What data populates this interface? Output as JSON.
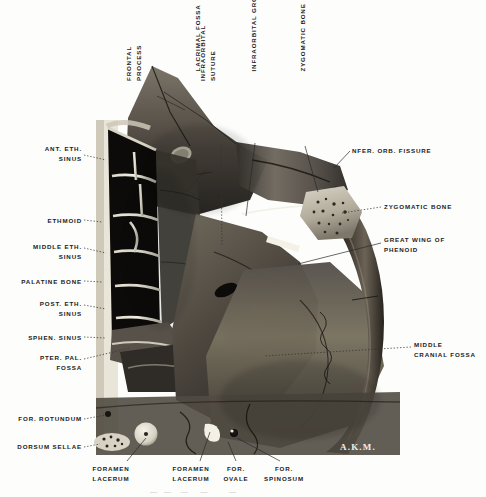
{
  "figure": {
    "signature": "A.K.M.",
    "caption_partial": "—  —   —    —       —",
    "background_color": "#fdfdfb",
    "plate_bounds": {
      "x": 90,
      "y": 55,
      "width": 310,
      "height": 400
    }
  },
  "labels": {
    "vertical_top": [
      {
        "id": "frontal-process",
        "text": "FRONTAL\nPROCESS",
        "x": 143,
        "y": 62,
        "lines": 2
      },
      {
        "id": "lacrimal-fossa",
        "text": "LACRIMAL FOSSA",
        "x": 200,
        "y": 62,
        "lines": 1
      },
      {
        "id": "infraorbital-suture",
        "text": "INFRAORBITAL\nSUTURE",
        "x": 216,
        "y": 62,
        "lines": 2
      },
      {
        "id": "infraorbital-groove",
        "text": "INFRAORBITAL GROOVE",
        "x": 259,
        "y": 62,
        "lines": 1
      },
      {
        "id": "zygomatic-bone-top",
        "text": "ZYGOMATIC BONE",
        "x": 308,
        "y": 62,
        "lines": 1
      }
    ],
    "left_column": [
      {
        "id": "ant-eth-sinus",
        "text": "ANT. ETH.\nSINUS",
        "x": 10,
        "y": 145,
        "w": 72
      },
      {
        "id": "ethmoid",
        "text": "ETHMOID",
        "x": 10,
        "y": 218,
        "w": 72
      },
      {
        "id": "middle-eth-sinus",
        "text": "MIDDLE ETH.\nSINUS",
        "x": 10,
        "y": 242,
        "w": 72
      },
      {
        "id": "palatine-bone",
        "text": "PALATINE BONE",
        "x": 10,
        "y": 278,
        "w": 72
      },
      {
        "id": "post-eth-sinus",
        "text": "POST. ETH.\nSINUS",
        "x": 10,
        "y": 298,
        "w": 72
      },
      {
        "id": "sphen-sinus",
        "text": "SPHEN. SINUS",
        "x": 10,
        "y": 334,
        "w": 72
      },
      {
        "id": "pter-pal-fossa",
        "text": "PTER. PAL.\nFOSSA",
        "x": 10,
        "y": 355,
        "w": 72
      },
      {
        "id": "for-rotundum",
        "text": "FOR. ROTUNDUM",
        "x": 10,
        "y": 416,
        "w": 72
      },
      {
        "id": "dorsum-sellae",
        "text": "DORSUM SELLAE",
        "x": 10,
        "y": 444,
        "w": 72
      }
    ],
    "right_column": [
      {
        "id": "infer-orb-fissure",
        "text": "NFER. ORB. FISSURE",
        "x": 352,
        "y": 147
      },
      {
        "id": "zygomatic-bone-right",
        "text": "ZYGOMATIC BONE",
        "x": 384,
        "y": 202
      },
      {
        "id": "great-wing-of-sphenoid",
        "text": "GREAT WING OF\nPHENOID",
        "x": 384,
        "y": 236
      },
      {
        "id": "middle-cranial-fossa",
        "text": "MIDDLE\nCRANIAL FOSSA",
        "x": 414,
        "y": 341
      }
    ],
    "bottom_row": [
      {
        "id": "foramen-lacerum-1",
        "text": "FORAMEN\nLACERUM",
        "x": 100,
        "y": 466
      },
      {
        "id": "foramen-lacerum-2",
        "text": "FORAMEN\nLACERUM",
        "x": 176,
        "y": 466
      },
      {
        "id": "for-ovale",
        "text": "FOR.\nOVALE",
        "x": 228,
        "y": 466
      },
      {
        "id": "for-spinosum",
        "text": "FOR.\nSPINOSUM",
        "x": 266,
        "y": 466
      }
    ]
  },
  "leaders": {
    "description": "dotted and solid leader lines connecting labels to anatomy",
    "solid": [
      {
        "id": "leader-frontal-process",
        "d": "M 157 96 L 185 110"
      },
      {
        "id": "leader-lacrimal-fossa",
        "d": "M 206 170 L 183 195"
      },
      {
        "id": "leader-infraorbital-groove",
        "d": "M 255 143 L 245 218"
      },
      {
        "id": "leader-zygomatic-top",
        "d": "M 305 146 L 318 194"
      },
      {
        "id": "leader-infer-orb-fissure",
        "d": "M 350 150 L 334 167"
      },
      {
        "id": "leader-great-wing",
        "d": "M 381 243 L 300 263"
      },
      {
        "id": "leader-for-lacerum-1",
        "d": "M 127 460 L 145 437"
      },
      {
        "id": "leader-for-lacerum-2",
        "d": "M 200 460 L 208 433"
      },
      {
        "id": "leader-for-ovale",
        "d": "M 236 460 L 229 441"
      },
      {
        "id": "leader-for-spinosum",
        "d": "M 280 460 L 236 437"
      }
    ],
    "dotted": [
      {
        "id": "leader-ant-eth-sinus",
        "d": "M 84 154 L 104 160"
      },
      {
        "id": "leader-ethmoid",
        "d": "M 84 220 L 100 222"
      },
      {
        "id": "leader-middle-eth-sinus",
        "d": "M 84 248 L 104 252"
      },
      {
        "id": "leader-palatine-bone",
        "d": "M 84 280 L 100 281"
      },
      {
        "id": "leader-post-eth-sinus",
        "d": "M 84 305 L 104 308"
      },
      {
        "id": "leader-sphen-sinus",
        "d": "M 84 336 L 104 337"
      },
      {
        "id": "leader-pter-pal-fossa",
        "d": "M 84 358 L 128 347"
      },
      {
        "id": "leader-for-rotundum",
        "d": "M 84 418 L 104 414"
      },
      {
        "id": "leader-dorsum-sellae",
        "d": "M 84 446 L 102 443"
      },
      {
        "id": "leader-infraorbital-suture",
        "d": "M 221 143 L 221 247"
      },
      {
        "id": "leader-zygomatic-right",
        "d": "M 381 206 L 340 212"
      },
      {
        "id": "leader-middle-cranial-fossa",
        "d": "M 411 346 L 262 355"
      }
    ]
  },
  "anatomy": {
    "regions": [
      {
        "id": "frontal-process-maxilla",
        "name": "Frontal process of maxilla"
      },
      {
        "id": "lacrimal-fossa-region",
        "name": "Lacrimal fossa"
      },
      {
        "id": "ethmoid-air-cells",
        "name": "Ethmoidal air cells",
        "cell_count": 7
      },
      {
        "id": "orbital-floor",
        "name": "Orbital floor with infraorbital groove"
      },
      {
        "id": "zygomatic-arch",
        "name": "Zygomatic arch"
      },
      {
        "id": "greater-wing-sphenoid",
        "name": "Greater wing of sphenoid"
      },
      {
        "id": "middle-cranial-fossa-region",
        "name": "Middle cranial fossa"
      },
      {
        "id": "sphenoid-sinus-region",
        "name": "Sphenoid sinus"
      },
      {
        "id": "pterygopalatine-fossa-region",
        "name": "Pterygopalatine fossa"
      },
      {
        "id": "dorsum-sellae-region",
        "name": "Dorsum sellae"
      }
    ],
    "foramina": [
      {
        "id": "foramen-rotundum-mark",
        "cx": 108,
        "cy": 414,
        "r": 3.0
      },
      {
        "id": "foramen-lacerum-mark-1",
        "cx": 146,
        "cy": 434,
        "r": 11.5
      },
      {
        "id": "foramen-ovale-mark",
        "cx": 212,
        "cy": 430,
        "r": 7.0
      },
      {
        "id": "foramen-spinosum-mark",
        "cx": 234,
        "cy": 434,
        "r": 4.0
      },
      {
        "id": "lacrimal-fossa-mark",
        "cx": 181,
        "cy": 155,
        "r": 8.0
      }
    ],
    "colors": {
      "bone_light": "#cfc9bb",
      "bone_mid": "#8d8577",
      "bone_dark": "#4b4640",
      "cavity_black": "#0e0d0c",
      "septum_white": "#efece1",
      "paper": "#fdfdfb"
    }
  }
}
